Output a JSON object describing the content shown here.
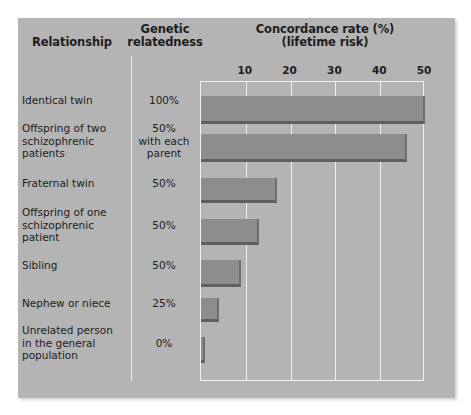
{
  "headers": {
    "relationship": "Relationship",
    "genetic_relatedness": "Genetic\nrelatedness",
    "genetic_relatedness_line1": "Genetic",
    "genetic_relatedness_line2": "relatedness",
    "concordance_line1": "Concordance rate (%)",
    "concordance_line2": "(lifetime risk)"
  },
  "rows": [
    {
      "relationship": "Identical twin",
      "relatedness": "100%",
      "concordance": 50
    },
    {
      "relationship": "Offspring of two schizophrenic patients",
      "relatedness": "50% with each parent",
      "concordance": 46
    },
    {
      "relationship": "Fraternal twin",
      "relatedness": "50%",
      "concordance": 17
    },
    {
      "relationship": "Offspring of one schizophrenic patient",
      "relatedness": "50%",
      "concordance": 13
    },
    {
      "relationship": "Sibling",
      "relatedness": "50%",
      "concordance": 9
    },
    {
      "relationship": "Nephew or niece",
      "relatedness": "25%",
      "concordance": 4
    },
    {
      "relationship": "Unrelated person in the general population",
      "relatedness": "0%",
      "concordance": 1
    }
  ],
  "axis": {
    "ticks": [
      "10",
      "20",
      "30",
      "40",
      "50"
    ],
    "min": 0,
    "max": 50
  },
  "colors": {
    "panel": "#b4b4b4",
    "bar": "#8d8d8d",
    "bar_shadow": "#5f5f5f",
    "gridline": "#f2f2f2",
    "text": "#1d1d1d"
  },
  "chart_data": {
    "type": "bar",
    "orientation": "horizontal",
    "title": "Concordance rate (%) (lifetime risk)",
    "xlabel": "Concordance rate (%) (lifetime risk)",
    "ylabel": "Relationship",
    "categories": [
      "Identical twin",
      "Offspring of two schizophrenic patients",
      "Fraternal twin",
      "Offspring of one schizophrenic patient",
      "Sibling",
      "Nephew or niece",
      "Unrelated person in the general population"
    ],
    "values": [
      50,
      46,
      17,
      13,
      9,
      4,
      1
    ],
    "secondary_labels": [
      "100%",
      "50% with each parent",
      "50%",
      "50%",
      "50%",
      "25%",
      "0%"
    ],
    "secondary_label_header": "Genetic relatedness",
    "xlim": [
      0,
      50
    ],
    "xticks": [
      10,
      20,
      30,
      40,
      50
    ],
    "grid": true,
    "legend": "none"
  }
}
